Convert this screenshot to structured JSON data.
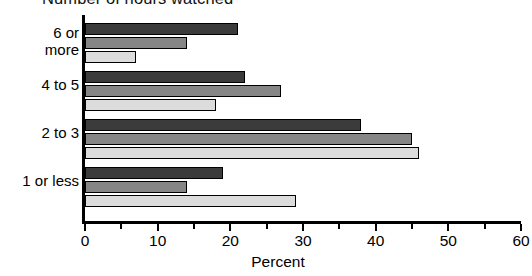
{
  "chart_data": {
    "type": "bar",
    "orientation": "horizontal",
    "title": "Number of hours watched",
    "xlabel": "Percent",
    "ylabel": "",
    "xlim": [
      0,
      60
    ],
    "xticks": [
      0,
      10,
      20,
      30,
      40,
      50,
      60
    ],
    "xtick_labels": [
      "0",
      "10",
      "20",
      "30",
      "40",
      "50",
      "60"
    ],
    "minor_tick_step": 5,
    "grid": false,
    "legend": "none",
    "categories": [
      "6 or more",
      "4 to 5",
      "2 to 3",
      "1 or less"
    ],
    "category_lines": [
      [
        "6 or",
        "more"
      ],
      [
        "4 to 5"
      ],
      [
        "2 to 3"
      ],
      [
        "1 or less"
      ]
    ],
    "series": [
      {
        "name": "series-1",
        "color": "#3b3b3b",
        "values": [
          21,
          22,
          38,
          19
        ]
      },
      {
        "name": "series-2",
        "color": "#868686",
        "values": [
          14,
          27,
          45,
          14
        ]
      },
      {
        "name": "series-3",
        "color": "#dcdcdc",
        "values": [
          29,
          18,
          46,
          29
        ]
      }
    ],
    "series_values_by_category": [
      {
        "category": "6 or more",
        "values": [
          21,
          14,
          7
        ]
      },
      {
        "category": "4 to 5",
        "values": [
          22,
          27,
          18
        ]
      },
      {
        "category": "2 to 3",
        "values": [
          38,
          45,
          46
        ]
      },
      {
        "category": "1 or less",
        "values": [
          19,
          14,
          29
        ]
      }
    ],
    "axis_color": "#000000",
    "background": "#ffffff"
  }
}
